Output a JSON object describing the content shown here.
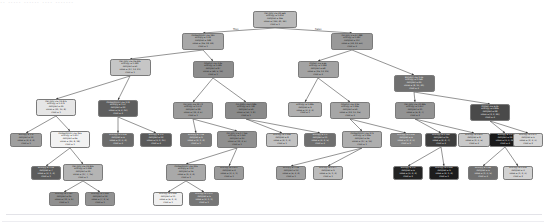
{
  "figure": {
    "clipped_title": "  ··   ····· ······ ···· ·······",
    "type": "decision-tree",
    "background": "#ffffff",
    "edge_color": "#3b3b3b",
    "node_border": "#7a7a7a"
  },
  "edge_labels": {
    "left": "True",
    "right": "False"
  },
  "chart_data": {
    "type": "tree",
    "criterion": "entropy",
    "class_names": [
      "1",
      "2"
    ],
    "feature_names": [
      "AST(U/L)",
      "ALT(U/L)",
      "Platelets",
      "Albumin",
      "Bilirubin",
      "Protein",
      "A/G Ratio"
    ],
    "levels": 6,
    "node_count": 40,
    "colormap": "grayscale: light = impure, dark = pure",
    "nodes": [
      {
        "id": 0,
        "level": 0,
        "x": 275.0,
        "y": 11.0,
        "w": 44,
        "h": 17,
        "fill": "#b9b9b9",
        "text": "#111111",
        "condition": "AST(U/L) <= 42.669",
        "entropy": "entropy = 1.414",
        "samples": "samples = 265",
        "value": "value = [130, 41, 94]",
        "cls": "class = 1"
      },
      {
        "id": 1,
        "level": 1,
        "x": 203.0,
        "y": 33.0,
        "w": 42,
        "h": 17,
        "fill": "#a8a8a8",
        "text": "#111111",
        "condition": "Platelets(U/L) <= 180",
        "entropy": "entropy = 1.22",
        "samples": "samples = 148",
        "value": "value = [96, 18, 34]",
        "cls": "class = 1"
      },
      {
        "id": 2,
        "level": 1,
        "x": 352.0,
        "y": 33.0,
        "w": 42,
        "h": 17,
        "fill": "#999999",
        "text": "#111111",
        "condition": "ALT(U/L) <= 47.288",
        "entropy": "entropy = 1.387",
        "samples": "samples = 117",
        "value": "value = [34, 23, 60]",
        "cls": "class = 3"
      },
      {
        "id": 3,
        "level": 2,
        "x": 130.0,
        "y": 59.0,
        "w": 41,
        "h": 17,
        "fill": "#c6c6c6",
        "text": "#111111",
        "condition": "AST(U/L) <= 26.435",
        "entropy": "entropy = 1.381",
        "samples": "samples = 61",
        "value": "value = [27, 13, 21]",
        "cls": "class = 1"
      },
      {
        "id": 4,
        "level": 2,
        "x": 213.0,
        "y": 61.0,
        "w": 41,
        "h": 17,
        "fill": "#8d8d8d",
        "text": "#111111",
        "condition": "Albumin <= 3.45",
        "entropy": "entropy = 1.089",
        "samples": "samples = 87",
        "value": "value = [69, 5, 13]",
        "cls": "class = 1"
      },
      {
        "id": 5,
        "level": 2,
        "x": 318.0,
        "y": 61.0,
        "w": 41,
        "h": 17,
        "fill": "#a3a3a3",
        "text": "#111111",
        "condition": "Protein <= 6.65",
        "entropy": "entropy = 1.284",
        "samples": "samples = 68",
        "value": "value = [26, 13, 29]",
        "cls": "class = 3"
      },
      {
        "id": 6,
        "level": 2,
        "x": 414.0,
        "y": 75.0,
        "w": 41,
        "h": 17,
        "fill": "#707070",
        "text": "#f5f5f5",
        "condition": "Bilirubin <= 1.05",
        "entropy": "entropy = 1.169",
        "samples": "samples = 49",
        "value": "value = [8, 10, 31]",
        "cls": "class = 3"
      },
      {
        "id": 7,
        "level": 3,
        "x": 56.0,
        "y": 99.0,
        "w": 40,
        "h": 17,
        "fill": "#e6e6e6",
        "text": "#111111",
        "condition": "AST(U/L) <= 19.875",
        "entropy": "entropy = 1.379",
        "samples": "samples = 39",
        "value": "value = [21, 10, 8]",
        "cls": "class = 1"
      },
      {
        "id": 8,
        "level": 3,
        "x": 118.0,
        "y": 100.0,
        "w": 40,
        "h": 17,
        "fill": "#5e5e5e",
        "text": "#f5f5f5",
        "condition": "Platelets(U/L) <= 178",
        "entropy": "entropy = 1.07",
        "samples": "samples = 22",
        "value": "value = [6, 3, 13]",
        "cls": "class = 3"
      },
      {
        "id": 9,
        "level": 3,
        "x": 193.0,
        "y": 102.0,
        "w": 40,
        "h": 17,
        "fill": "#9b9b9b",
        "text": "#111111",
        "condition": "ALT(U/L) <= 22.72",
        "entropy": "entropy = 1.073",
        "samples": "samples = 28",
        "value": "value = [19, 4, 5]",
        "cls": "class = 1"
      },
      {
        "id": 10,
        "level": 3,
        "x": 246.0,
        "y": 102.0,
        "w": 42,
        "h": 17,
        "fill": "#8a8a8a",
        "text": "#111111",
        "condition": "A/G Ratio <= 0.985",
        "entropy": "entropy = 0.738",
        "samples": "samples = 59",
        "value": "value = [50, 1, 8]",
        "cls": "class = 1"
      },
      {
        "id": 11,
        "level": 3,
        "x": 305.0,
        "y": 102.0,
        "w": 34,
        "h": 15,
        "fill": "#b0b0b0",
        "text": "#111111",
        "condition": "",
        "entropy": "entropy = 1.485",
        "samples": "samples = 9",
        "value": "value = [3, 3, 3]",
        "cls": "class = 1"
      },
      {
        "id": 12,
        "level": 3,
        "x": 350.0,
        "y": 102.0,
        "w": 40,
        "h": 17,
        "fill": "#a6a6a6",
        "text": "#111111",
        "condition": "Albumin <= 3.95",
        "entropy": "entropy = 1.246",
        "samples": "samples = 59",
        "value": "value = [23, 10, 26]",
        "cls": "class = 3"
      },
      {
        "id": 13,
        "level": 3,
        "x": 415.0,
        "y": 102.0,
        "w": 40,
        "h": 17,
        "fill": "#939393",
        "text": "#111111",
        "condition": "AST(U/L) <= 31.845",
        "entropy": "entropy = 1.407",
        "samples": "samples = 21",
        "value": "value = [6, 8, 7]",
        "cls": "class = 2"
      },
      {
        "id": 14,
        "level": 3,
        "x": 490.0,
        "y": 104.0,
        "w": 40,
        "h": 17,
        "fill": "#4a4a4a",
        "text": "#f5f5f5",
        "condition": "Protein <= 6.05",
        "entropy": "entropy = 0.845",
        "samples": "samples = 28",
        "value": "value = [2, 2, 24]",
        "cls": "class = 3"
      },
      {
        "id": 15,
        "level": 4,
        "x": 26.0,
        "y": 133.0,
        "w": 32,
        "h": 14,
        "fill": "#9f9f9f",
        "text": "#111111",
        "condition": "",
        "entropy": "entropy = 1.5",
        "samples": "samples = 12",
        "value": "value = [4, 4, 4]",
        "cls": "class = 1"
      },
      {
        "id": 16,
        "level": 4,
        "x": 70.0,
        "y": 131.0,
        "w": 40,
        "h": 17,
        "fill": "#f2f2f2",
        "text": "#111111",
        "condition": "Platelets(U/L) <= 255",
        "entropy": "entropy = 1.417",
        "samples": "samples = 46",
        "value": "value = [20, 8, 18]",
        "cls": "class = 1"
      },
      {
        "id": 17,
        "level": 4,
        "x": 118.0,
        "y": 133.0,
        "w": 32,
        "h": 14,
        "fill": "#6b6b6b",
        "text": "#f5f5f5",
        "condition": "",
        "entropy": "entropy = 0.918",
        "samples": "samples = 6",
        "value": "value = [2, 0, 4]",
        "cls": "class = 3"
      },
      {
        "id": 18,
        "level": 4,
        "x": 156.0,
        "y": 133.0,
        "w": 32,
        "h": 14,
        "fill": "#5a5a5a",
        "text": "#f5f5f5",
        "condition": "",
        "entropy": "entropy = 1.0",
        "samples": "samples = 12",
        "value": "value = [0, 2, 10]",
        "cls": "class = 3"
      },
      {
        "id": 19,
        "level": 4,
        "x": 196.0,
        "y": 133.0,
        "w": 32,
        "h": 14,
        "fill": "#7c7c7c",
        "text": "#f5f5f5",
        "condition": "",
        "entropy": "entropy = 1.06",
        "samples": "samples = 9",
        "value": "value = [4, 1, 4]",
        "cls": "class = 1"
      },
      {
        "id": 20,
        "level": 4,
        "x": 237.0,
        "y": 131.0,
        "w": 40,
        "h": 17,
        "fill": "#909090",
        "text": "#111111",
        "condition": "ALT(U/L) <= 17.155",
        "entropy": "entropy = 1.351",
        "samples": "samples = 20",
        "value": "value = [12, 3, 5]",
        "cls": "class = 1"
      },
      {
        "id": 21,
        "level": 4,
        "x": 282.0,
        "y": 133.0,
        "w": 32,
        "h": 14,
        "fill": "#c2c2c2",
        "text": "#111111",
        "condition": "",
        "entropy": "entropy = 1.235",
        "samples": "samples = 8",
        "value": "value = [4, 1, 3]",
        "cls": "class = 1"
      },
      {
        "id": 22,
        "level": 4,
        "x": 320.0,
        "y": 133.0,
        "w": 32,
        "h": 14,
        "fill": "#6f6f6f",
        "text": "#f5f5f5",
        "condition": "",
        "entropy": "entropy = 1.1",
        "samples": "samples = 11",
        "value": "value = [4, 2, 5]",
        "cls": "class = 3"
      },
      {
        "id": 23,
        "level": 4,
        "x": 362.0,
        "y": 131.0,
        "w": 40,
        "h": 17,
        "fill": "#aeaeae",
        "text": "#111111",
        "condition": "Platelets(U/L) <= 279",
        "entropy": "entropy = 1.226",
        "samples": "samples = 36",
        "value": "value = [17, 6, 13]",
        "cls": "class = 1"
      },
      {
        "id": 24,
        "level": 4,
        "x": 406.0,
        "y": 133.0,
        "w": 32,
        "h": 14,
        "fill": "#838383",
        "text": "#f5f5f5",
        "condition": "",
        "entropy": "entropy = 0.918",
        "samples": "samples = 6",
        "value": "value = [2, 4, 0]",
        "cls": "class = 2"
      },
      {
        "id": 25,
        "level": 4,
        "x": 441.0,
        "y": 133.0,
        "w": 32,
        "h": 14,
        "fill": "#3d3d3d",
        "text": "#f5f5f5",
        "condition": "",
        "entropy": "entropy = 1.149",
        "samples": "samples = 15",
        "value": "value = [4, 4, 7]",
        "cls": "class = 3"
      },
      {
        "id": 26,
        "level": 4,
        "x": 474.0,
        "y": 133.0,
        "w": 32,
        "h": 14,
        "fill": "#c9c9c9",
        "text": "#111111",
        "condition": "",
        "entropy": "entropy = 0.811",
        "samples": "samples = 8",
        "value": "value = [2, 0, 6]",
        "cls": "class = 3"
      },
      {
        "id": 27,
        "level": 4,
        "x": 505.0,
        "y": 133.0,
        "w": 32,
        "h": 14,
        "fill": "#1a1a1a",
        "text": "#f5f5f5",
        "condition": "",
        "entropy": "entropy = 0.0",
        "samples": "samples = 14",
        "value": "value = [0, 0, 14]",
        "cls": "class = 3"
      },
      {
        "id": 28,
        "level": 4,
        "x": 528.0,
        "y": 133.0,
        "w": 30,
        "h": 14,
        "fill": "#d6d6d6",
        "text": "#111111",
        "condition": "",
        "entropy": "entropy = 0.971",
        "samples": "samples = 5",
        "value": "value = [2, 3, 0]",
        "cls": "class = 2"
      },
      {
        "id": 29,
        "level": 5,
        "x": 46.0,
        "y": 166.0,
        "w": 30,
        "h": 14,
        "fill": "#5c5c5c",
        "text": "#f5f5f5",
        "condition": "",
        "entropy": "entropy = 1.05",
        "samples": "samples = 7",
        "value": "value = [3, 1, 3]",
        "cls": "class = 1"
      },
      {
        "id": 30,
        "level": 5,
        "x": 83.0,
        "y": 164.0,
        "w": 40,
        "h": 17,
        "fill": "#b4b4b4",
        "text": "#111111",
        "condition": "AST(U/L) <= 23.805",
        "entropy": "entropy = 1.398",
        "samples": "samples = 39",
        "value": "value = [17, 7, 15]",
        "cls": "class = 1"
      },
      {
        "id": 31,
        "level": 5,
        "x": 186.0,
        "y": 164.0,
        "w": 40,
        "h": 17,
        "fill": "#a9a9a9",
        "text": "#111111",
        "condition": "Platelets(U/L) <= 236",
        "entropy": "entropy = 1.27",
        "samples": "samples = 16",
        "value": "value = [9, 3, 4]",
        "cls": "class = 1"
      },
      {
        "id": 32,
        "level": 5,
        "x": 229.0,
        "y": 166.0,
        "w": 30,
        "h": 14,
        "fill": "#9c9c9c",
        "text": "#111111",
        "condition": "",
        "entropy": "entropy = 0.811",
        "samples": "samples = 4",
        "value": "value = [3, 0, 1]",
        "cls": "class = 1"
      },
      {
        "id": 33,
        "level": 5,
        "x": 291.0,
        "y": 166.0,
        "w": 30,
        "h": 14,
        "fill": "#9f9f9f",
        "text": "#111111",
        "condition": "",
        "entropy": "entropy = 1.26",
        "samples": "samples = 13",
        "value": "value = [6, 3, 4]",
        "cls": "class = 1"
      },
      {
        "id": 34,
        "level": 5,
        "x": 328.0,
        "y": 166.0,
        "w": 30,
        "h": 14,
        "fill": "#bcbcbc",
        "text": "#111111",
        "condition": "",
        "entropy": "entropy = 0.977",
        "samples": "samples = 9",
        "value": "value = [5, 1, 3]",
        "cls": "class = 1"
      },
      {
        "id": 35,
        "level": 5,
        "x": 408.0,
        "y": 166.0,
        "w": 30,
        "h": 14,
        "fill": "#232323",
        "text": "#f5f5f5",
        "condition": "",
        "entropy": "entropy = 1.0",
        "samples": "samples = 6",
        "value": "value = [0, 3, 3]",
        "cls": "class = 2"
      },
      {
        "id": 36,
        "level": 5,
        "x": 444.0,
        "y": 166.0,
        "w": 30,
        "h": 14,
        "fill": "#1c1c1c",
        "text": "#f5f5f5",
        "condition": "",
        "entropy": "entropy = 0.994",
        "samples": "samples = 9",
        "value": "value = [4, 1, 4]",
        "cls": "class = 1"
      },
      {
        "id": 37,
        "level": 5,
        "x": 483.0,
        "y": 166.0,
        "w": 30,
        "h": 14,
        "fill": "#707070",
        "text": "#f5f5f5",
        "condition": "",
        "entropy": "entropy = 0.65",
        "samples": "samples = 6",
        "value": "value = [1, 0, 5]",
        "cls": "class = 3"
      },
      {
        "id": 38,
        "level": 5,
        "x": 518.0,
        "y": 166.0,
        "w": 30,
        "h": 14,
        "fill": "#d2d2d2",
        "text": "#111111",
        "condition": "",
        "entropy": "entropy = 0.918",
        "samples": "samples = 3",
        "value": "value = [1, 2, 0]",
        "cls": "class = 2"
      },
      {
        "id": 39,
        "level": 6,
        "x": 64.0,
        "y": 192.0,
        "w": 30,
        "h": 14,
        "fill": "#8f8f8f",
        "text": "#111111",
        "condition": "",
        "entropy": "entropy = 1.187",
        "samples": "samples = 25",
        "value": "value = [11, 5, 9]",
        "cls": "class = 1"
      },
      {
        "id": 40,
        "level": 6,
        "x": 100.0,
        "y": 192.0,
        "w": 30,
        "h": 14,
        "fill": "#929292",
        "text": "#111111",
        "condition": "",
        "entropy": "entropy = 1.399",
        "samples": "samples = 14",
        "value": "value = [7, 2, 5]",
        "cls": "class = 1"
      },
      {
        "id": 41,
        "level": 6,
        "x": 168.0,
        "y": 192.0,
        "w": 30,
        "h": 14,
        "fill": "#efefef",
        "text": "#111111",
        "condition": "",
        "entropy": "entropy = 0.994",
        "samples": "samples = 11",
        "value": "value = [6, 2, 3]",
        "cls": "class = 1"
      },
      {
        "id": 42,
        "level": 6,
        "x": 204.0,
        "y": 192.0,
        "w": 30,
        "h": 14,
        "fill": "#767676",
        "text": "#f5f5f5",
        "condition": "",
        "entropy": "entropy = 1.371",
        "samples": "samples = 5",
        "value": "value = [3, 1, 1]",
        "cls": "class = 1"
      }
    ],
    "edges": [
      {
        "from": 0,
        "to": 1,
        "label": "True"
      },
      {
        "from": 0,
        "to": 2,
        "label": "False"
      },
      {
        "from": 1,
        "to": 3,
        "label": ""
      },
      {
        "from": 1,
        "to": 4,
        "label": ""
      },
      {
        "from": 2,
        "to": 5,
        "label": ""
      },
      {
        "from": 2,
        "to": 6,
        "label": ""
      },
      {
        "from": 3,
        "to": 7,
        "label": ""
      },
      {
        "from": 3,
        "to": 8,
        "label": ""
      },
      {
        "from": 4,
        "to": 9,
        "label": ""
      },
      {
        "from": 4,
        "to": 10,
        "label": ""
      },
      {
        "from": 5,
        "to": 11,
        "label": ""
      },
      {
        "from": 5,
        "to": 12,
        "label": ""
      },
      {
        "from": 6,
        "to": 13,
        "label": ""
      },
      {
        "from": 6,
        "to": 14,
        "label": ""
      },
      {
        "from": 7,
        "to": 15,
        "label": ""
      },
      {
        "from": 7,
        "to": 16,
        "label": ""
      },
      {
        "from": 8,
        "to": 17,
        "label": ""
      },
      {
        "from": 8,
        "to": 18,
        "label": ""
      },
      {
        "from": 9,
        "to": 19,
        "label": ""
      },
      {
        "from": 9,
        "to": 20,
        "label": ""
      },
      {
        "from": 10,
        "to": 21,
        "label": ""
      },
      {
        "from": 10,
        "to": 22,
        "label": ""
      },
      {
        "from": 12,
        "to": 23,
        "label": ""
      },
      {
        "from": 12,
        "to": 24,
        "label": ""
      },
      {
        "from": 13,
        "to": 25,
        "label": ""
      },
      {
        "from": 13,
        "to": 26,
        "label": ""
      },
      {
        "from": 14,
        "to": 27,
        "label": ""
      },
      {
        "from": 14,
        "to": 28,
        "label": ""
      },
      {
        "from": 16,
        "to": 29,
        "label": ""
      },
      {
        "from": 16,
        "to": 30,
        "label": ""
      },
      {
        "from": 20,
        "to": 31,
        "label": ""
      },
      {
        "from": 20,
        "to": 32,
        "label": ""
      },
      {
        "from": 23,
        "to": 33,
        "label": ""
      },
      {
        "from": 23,
        "to": 34,
        "label": ""
      },
      {
        "from": 25,
        "to": 35,
        "label": ""
      },
      {
        "from": 25,
        "to": 36,
        "label": ""
      },
      {
        "from": 27,
        "to": 37,
        "label": ""
      },
      {
        "from": 27,
        "to": 38,
        "label": ""
      },
      {
        "from": 30,
        "to": 39,
        "label": ""
      },
      {
        "from": 30,
        "to": 40,
        "label": ""
      },
      {
        "from": 31,
        "to": 41,
        "label": ""
      },
      {
        "from": 31,
        "to": 42,
        "label": ""
      }
    ]
  }
}
